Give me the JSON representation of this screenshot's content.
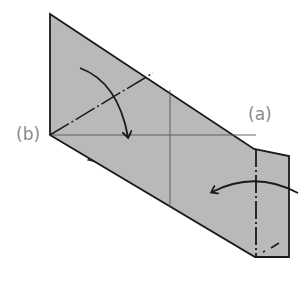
{
  "diagram": {
    "type": "origami-fold-instruction",
    "labels": {
      "a": "(a)",
      "b": "(b)"
    },
    "colors": {
      "paper": "#b9b9b9",
      "outline": "#1a1a1a",
      "crease": "#555555",
      "label": "#8a8a8a",
      "background": "#ffffff"
    },
    "arrows": [
      {
        "name": "fold-down-arrow",
        "direction": "down",
        "description": "curved arrow folding top flap down"
      },
      {
        "name": "fold-left-arrow",
        "direction": "left",
        "description": "curved arrow folding right flap left"
      }
    ],
    "lines": [
      {
        "name": "valley-fold-diagonal",
        "style": "dash-dot"
      },
      {
        "name": "valley-fold-vertical",
        "style": "dash-dot"
      },
      {
        "name": "crease-horizontal",
        "style": "thin"
      },
      {
        "name": "crease-vertical",
        "style": "thin"
      }
    ]
  }
}
